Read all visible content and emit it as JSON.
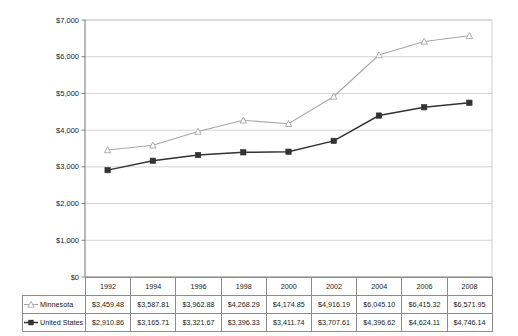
{
  "chart_data": {
    "type": "line",
    "title": "",
    "subtitle": "",
    "xlabel": "",
    "ylabel": "",
    "categories": [
      "1992",
      "1994",
      "1996",
      "1998",
      "2000",
      "2002",
      "2004",
      "2006",
      "2008"
    ],
    "ylim": [
      0,
      7000
    ],
    "ytick_values": [
      0,
      1000,
      2000,
      3000,
      4000,
      5000,
      6000,
      7000
    ],
    "ytick_labels": [
      "$0",
      "$1,000",
      "$2,000",
      "$3,000",
      "$4,000",
      "$5,000",
      "$6,000",
      "$7,000"
    ],
    "grid": true,
    "grid_axis": "y",
    "legend_position": "data-table-left",
    "series": [
      {
        "name": "Minnesota",
        "marker": "open-triangle",
        "color": "#a6a6a6",
        "values": [
          3459.48,
          3587.81,
          3962.88,
          4268.29,
          4174.85,
          4916.19,
          6045.1,
          6415.32,
          6571.95
        ],
        "labels": [
          "$3,459.48",
          "$3,587.81",
          "$3,962.88",
          "$4,268.29",
          "$4,174.85",
          "$4,916.19",
          "$6,045.10",
          "$6,415.32",
          "$6,571.95"
        ]
      },
      {
        "name": "United States",
        "marker": "filled-square",
        "color": "#333333",
        "values": [
          2910.86,
          3165.71,
          3321.67,
          3396.33,
          3411.74,
          3707.61,
          4396.62,
          4624.11,
          4746.14
        ],
        "labels": [
          "$2,910.86",
          "$3,165.71",
          "$3,321.67",
          "$3,396.33",
          "$3,411.74",
          "$3,707.61",
          "$4,396.62",
          "$4,624.11",
          "$4,746.14"
        ]
      }
    ]
  },
  "colors": {
    "series_minnesota": "#a6a6a6",
    "series_united_states": "#333333",
    "gridline": "#c8c8c8",
    "axis": "#808080",
    "table_border": "#8c8c8c",
    "text": "#1a1a1a",
    "background": "#ffffff"
  }
}
